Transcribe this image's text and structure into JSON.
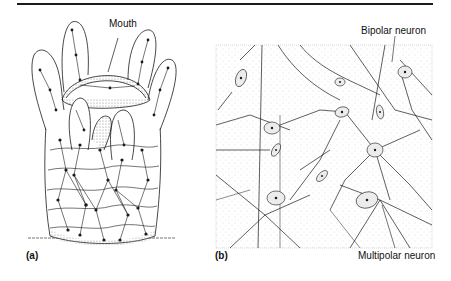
{
  "figure": {
    "panels": [
      {
        "id": "a",
        "letter": "(a)",
        "subject": "hydra-nerve-net",
        "labels": {
          "mouth": "Mouth"
        }
      },
      {
        "id": "b",
        "letter": "(b)",
        "subject": "neuron-network",
        "labels": {
          "bipolar": "Bipolar neuron",
          "multipolar": "Multipolar neuron"
        }
      }
    ],
    "colors": {
      "ink": "#1a1a1a",
      "stipple": "#b8b8b8",
      "background": "#ffffff"
    }
  }
}
